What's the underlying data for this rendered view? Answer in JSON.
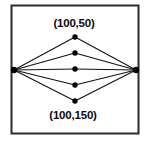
{
  "figure": {
    "background_color": "#ffffff",
    "border": {
      "name": "figure-border",
      "color": "#2b2b2b",
      "x": 11.5,
      "y": 5.5,
      "width": 127,
      "height": 128,
      "stroke_width": 2
    },
    "edge_color": "#111111",
    "edge_stroke_width": 1.1,
    "node_color": "#000000",
    "node_radius": 2.7,
    "apex_radius": 3.2,
    "labels": {
      "top": "(100,50)",
      "bottom": "(100,150)"
    },
    "label_positions": {
      "top": {
        "x": 74,
        "y": 27
      },
      "bottom": {
        "x": 73,
        "y": 119
      }
    },
    "vertices": {
      "left": {
        "name": "left-apex-node",
        "x": 14,
        "y": 70
      },
      "right": {
        "name": "right-apex-node",
        "x": 136,
        "y": 70
      }
    },
    "middle_nodes": [
      {
        "name": "middle-node-1",
        "x": 75,
        "y": 37
      },
      {
        "name": "middle-node-2",
        "x": 75,
        "y": 53
      },
      {
        "name": "middle-node-3",
        "x": 75,
        "y": 69
      },
      {
        "name": "middle-node-4",
        "x": 75,
        "y": 85
      },
      {
        "name": "middle-node-5",
        "x": 75,
        "y": 101
      }
    ]
  }
}
